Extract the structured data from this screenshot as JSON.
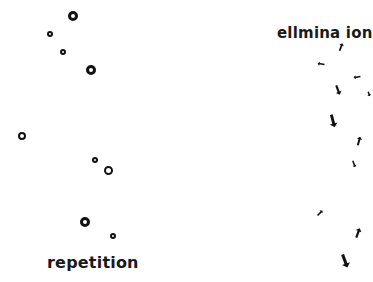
{
  "labels": {
    "left": "repetition",
    "right": "ellmina ion"
  },
  "colors": {
    "ink": "#111111",
    "background": "#ffffff"
  },
  "circles": [
    {
      "x": 73,
      "y": 16,
      "d": 10,
      "w": 3
    },
    {
      "x": 50,
      "y": 34,
      "d": 6,
      "w": 2
    },
    {
      "x": 63,
      "y": 52,
      "d": 6,
      "w": 2
    },
    {
      "x": 91,
      "y": 70,
      "d": 10,
      "w": 3
    },
    {
      "x": 22,
      "y": 136,
      "d": 8,
      "w": 2.5
    },
    {
      "x": 95,
      "y": 160,
      "d": 6,
      "w": 2
    },
    {
      "x": 108,
      "y": 170,
      "d": 9,
      "w": 2.5
    },
    {
      "x": 85,
      "y": 222,
      "d": 10,
      "w": 3
    },
    {
      "x": 113,
      "y": 236,
      "d": 6,
      "w": 2
    }
  ],
  "arrows": [
    {
      "x": 341,
      "y": 47,
      "len": 8,
      "rot": 200
    },
    {
      "x": 321,
      "y": 64,
      "len": 7,
      "rot": 100
    },
    {
      "x": 357,
      "y": 77,
      "len": 7,
      "rot": 80
    },
    {
      "x": 338,
      "y": 90,
      "len": 10,
      "rot": -20
    },
    {
      "x": 369,
      "y": 94,
      "len": 5,
      "rot": -20
    },
    {
      "x": 333,
      "y": 121,
      "len": 13,
      "rot": -15
    },
    {
      "x": 359,
      "y": 141,
      "len": 9,
      "rot": 195
    },
    {
      "x": 354,
      "y": 164,
      "len": 7,
      "rot": -20
    },
    {
      "x": 320,
      "y": 213,
      "len": 7,
      "rot": 225
    },
    {
      "x": 358,
      "y": 233,
      "len": 10,
      "rot": 200
    },
    {
      "x": 345,
      "y": 261,
      "len": 14,
      "rot": -20
    }
  ]
}
